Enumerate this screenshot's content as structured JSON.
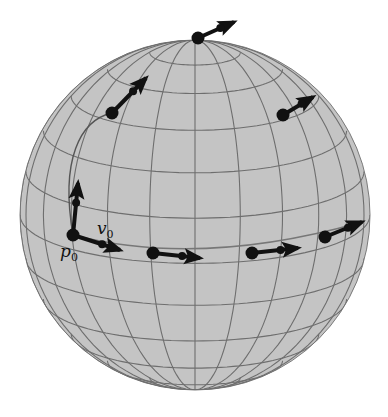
{
  "figure": {
    "colors": {
      "sphere_fill": "#c4c4c4",
      "grid_line": "#6e6e6e",
      "path_line": "#777777",
      "point": "#111111",
      "vector": "#111111",
      "background": "#ffffff"
    },
    "sphere": {
      "cx": 195,
      "cy": 215,
      "r": 175
    },
    "labels": {
      "point_label": {
        "main": "p",
        "sub": "0"
      },
      "vector_label": {
        "main": "v",
        "sub": "0"
      }
    },
    "points": [
      {
        "name": "p0",
        "x": 73,
        "y": 235
      },
      {
        "name": "bottom-1",
        "x": 153,
        "y": 253
      },
      {
        "name": "bottom-2",
        "x": 252,
        "y": 253
      },
      {
        "name": "bottom-3",
        "x": 325,
        "y": 237
      },
      {
        "name": "upper-right",
        "x": 283,
        "y": 115
      },
      {
        "name": "north-pole",
        "x": 198,
        "y": 38
      },
      {
        "name": "upper-left",
        "x": 112,
        "y": 113
      }
    ],
    "vectors": [
      {
        "name": "p0-up",
        "x1": 73,
        "y1": 235,
        "x2": 78,
        "y2": 183
      },
      {
        "name": "v0",
        "x1": 73,
        "y1": 235,
        "x2": 120,
        "y2": 250
      },
      {
        "name": "bottom-1",
        "x1": 153,
        "y1": 253,
        "x2": 200,
        "y2": 258
      },
      {
        "name": "bottom-2",
        "x1": 252,
        "y1": 253,
        "x2": 298,
        "y2": 248
      },
      {
        "name": "bottom-3",
        "x1": 325,
        "y1": 237,
        "x2": 362,
        "y2": 222
      },
      {
        "name": "upper-right",
        "x1": 283,
        "y1": 115,
        "x2": 313,
        "y2": 97
      },
      {
        "name": "north-pole",
        "x1": 198,
        "y1": 38,
        "x2": 234,
        "y2": 22
      },
      {
        "name": "upper-left",
        "x1": 112,
        "y1": 113,
        "x2": 146,
        "y2": 78
      }
    ]
  }
}
